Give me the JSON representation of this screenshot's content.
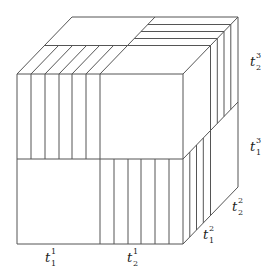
{
  "diagram": {
    "title": "",
    "labels": {
      "x_axis": [
        {
          "base": "t",
          "sub": "1",
          "sup": "1"
        },
        {
          "base": "t",
          "sub": "2",
          "sup": "1"
        }
      ],
      "depth_axis": [
        {
          "base": "t",
          "sub": "1",
          "sup": "2"
        },
        {
          "base": "t",
          "sub": "2",
          "sup": "2"
        }
      ],
      "vertical_axis": [
        {
          "base": "t",
          "sub": "1",
          "sup": "3"
        },
        {
          "base": "t",
          "sub": "2",
          "sup": "3"
        }
      ]
    },
    "stroke_color": "#555555",
    "background_color": "#ffffff"
  }
}
